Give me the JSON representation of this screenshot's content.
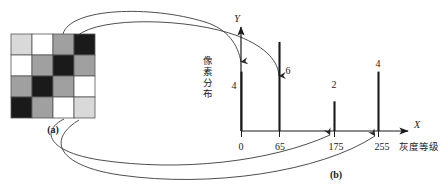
{
  "figure": {
    "panel_a_caption": "(a)",
    "panel_b_caption": "(b)",
    "grid": {
      "rows": 4,
      "cols": 4,
      "level_colors": {
        "black": "#1a1a1a",
        "mid_gray": "#a0a0a0",
        "light_gray": "#d9d9d9",
        "white": "#ffffff"
      },
      "cells": [
        [
          "light_gray",
          "white",
          "mid_gray",
          "black"
        ],
        [
          "white",
          "mid_gray",
          "black",
          "mid_gray"
        ],
        [
          "mid_gray",
          "black",
          "mid_gray",
          "white"
        ],
        [
          "black",
          "mid_gray",
          "white",
          "light_gray"
        ]
      ],
      "border_color": "#555555"
    }
  },
  "chart_data": {
    "type": "bar",
    "title": "",
    "xlabel": "灰度等级",
    "ylabel": "像素分布",
    "x_axis_name": "X",
    "y_axis_name": "Y",
    "categories": [
      "0",
      "65",
      "175",
      "255"
    ],
    "values": [
      4,
      6,
      2,
      4
    ],
    "value_labels": [
      "4",
      "6",
      "2",
      "4"
    ],
    "tick_labels": [
      "0",
      "65",
      "175",
      "255"
    ],
    "ylim": [
      0,
      7
    ],
    "xlim": [
      0,
      255
    ],
    "grid": false,
    "legend": null,
    "bar_color": "#1a1a1a"
  },
  "connectors": [
    {
      "name": "connector-light-gray-to-0",
      "target_tick": "0",
      "target_value": "4"
    },
    {
      "name": "connector-white-to-65",
      "target_tick": "65",
      "target_value": "6"
    },
    {
      "name": "connector-midgray-to-175",
      "target_tick": "175",
      "target_value": "2"
    },
    {
      "name": "connector-black-to-255",
      "target_tick": "255",
      "target_value": "4"
    }
  ]
}
